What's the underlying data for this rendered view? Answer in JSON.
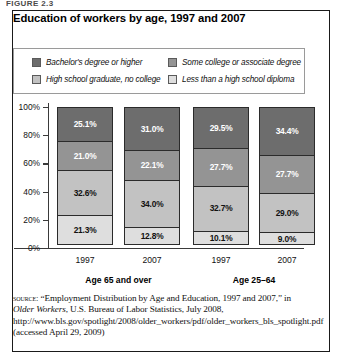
{
  "figure": {
    "caption": "FIGURE 2.3"
  },
  "chart_title": "Education of workers by age, 1997 and 2007",
  "legend": {
    "items": [
      {
        "label": "Bachelor's degree or higher",
        "color": "#6d6d6d",
        "key": "bachelors"
      },
      {
        "label": "High school graduate, no college",
        "color": "#c2c2c2",
        "key": "hs_grad"
      },
      {
        "label": "Some college or associate degree",
        "color": "#949494",
        "key": "some_college"
      },
      {
        "label": "Less than a high school diploma",
        "color": "#dedede",
        "key": "less_than_hs"
      }
    ]
  },
  "axis": {
    "y_ticks": [
      "100%",
      "80%",
      "60%",
      "40%",
      "20%",
      "0%"
    ],
    "y_values": [
      100,
      80,
      60,
      40,
      20,
      0
    ]
  },
  "groups": [
    {
      "label": "Age 65 and over"
    },
    {
      "label": "Age 25–64"
    }
  ],
  "source": {
    "keyword": "source:",
    "text_1": " “Employment Distribution by Age and Education, 1997 and 2007,” in ",
    "italic_1": "Older Workers",
    "text_2": ", U.S. Bureau of Labor Statistics, July 2008, http://www.bls.gov/spotlight/2008/older_workers/pdf/older_workers_bls_spotlight.pdf (accessed April 29, 2009)"
  },
  "chart_data": {
    "type": "bar",
    "subtype": "stacked-percent",
    "title": "Education of workers by age, 1997 and 2007",
    "xlabel": "",
    "ylabel": "",
    "ylim": [
      0,
      100
    ],
    "yticks": [
      0,
      20,
      40,
      60,
      80,
      100
    ],
    "ytick_labels": [
      "0%",
      "20%",
      "40%",
      "60%",
      "80%",
      "100%"
    ],
    "grid": false,
    "legend_position": "top",
    "categories": [
      "1997",
      "2007",
      "1997",
      "2007"
    ],
    "group_labels": [
      "Age 65 and over",
      "Age 25–64"
    ],
    "group_spans": [
      [
        0,
        1
      ],
      [
        2,
        3
      ]
    ],
    "stack_order_bottom_to_top": [
      "Less than a high school diploma",
      "High school graduate, no college",
      "Some college or associate degree",
      "Bachelor's degree or higher"
    ],
    "series": [
      {
        "name": "Less than a high school diploma",
        "color": "#dedede",
        "text_color": "#111111",
        "values": [
          21.3,
          12.8,
          10.1,
          9.0
        ],
        "labels": [
          "21.3%",
          "12.8%",
          "10.1%",
          "9.0%"
        ]
      },
      {
        "name": "High school graduate, no college",
        "color": "#c2c2c2",
        "text_color": "#111111",
        "values": [
          32.6,
          34.0,
          32.7,
          29.0
        ],
        "labels": [
          "32.6%",
          "34.0%",
          "32.7%",
          "29.0%"
        ]
      },
      {
        "name": "Some college or associate degree",
        "color": "#949494",
        "text_color": "#ffffff",
        "values": [
          21.0,
          22.1,
          27.7,
          27.7
        ],
        "labels": [
          "21.0%",
          "22.1%",
          "27.7%",
          "27.7%"
        ]
      },
      {
        "name": "Bachelor's degree or higher",
        "color": "#6d6d6d",
        "text_color": "#ffffff",
        "values": [
          25.1,
          31.0,
          29.5,
          34.4
        ],
        "labels": [
          "25.1%",
          "31.0%",
          "29.5%",
          "34.4%"
        ]
      }
    ]
  }
}
